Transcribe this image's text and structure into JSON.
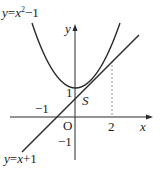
{
  "diagram": {
    "curve_label": "y=x²−1",
    "curve_label_parts": {
      "y": "y",
      "eq": "=",
      "x": "x",
      "sup": "2",
      "rest": "−1"
    },
    "line_label_parts": {
      "y": "y",
      "eq": "=",
      "x": "x",
      "rest": "+1"
    },
    "axis_x": "x",
    "axis_y": "y",
    "origin": "O",
    "region": "S",
    "tick_neg1_x": "−1",
    "tick_2_x": "2",
    "tick_1_y": "1",
    "tick_neg1_y": "−1",
    "colors": {
      "stroke": "#2a2a2a",
      "dashed": "#888888"
    }
  }
}
